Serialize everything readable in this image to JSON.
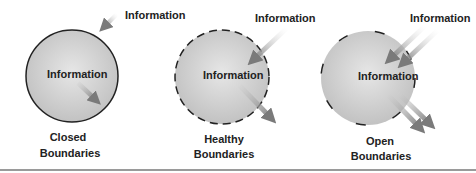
{
  "diagrams": [
    {
      "id": "closed",
      "inner_label": "Information",
      "incoming_label": "Information",
      "caption_line1": "Closed",
      "caption_line2": "Boundaries",
      "border": "solid"
    },
    {
      "id": "healthy",
      "inner_label": "Information",
      "incoming_label": "Information",
      "caption_line1": "Healthy",
      "caption_line2": "Boundaries",
      "border": "dashed"
    },
    {
      "id": "open",
      "inner_label": "Information",
      "incoming_label": "Information",
      "caption_line1": "Open",
      "caption_line2": "Boundaries",
      "border": "sparse-dashed"
    }
  ],
  "colors": {
    "circle_fill": "#cfcfcf",
    "circle_border": "#222222",
    "arrow": "#8a8a8a",
    "text": "#222222"
  }
}
